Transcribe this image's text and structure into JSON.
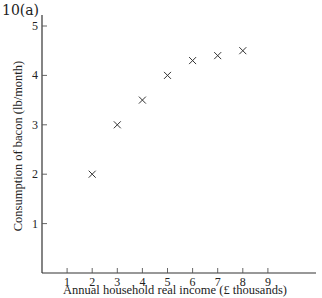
{
  "figure_label": "10(a)",
  "chart_data": {
    "type": "scatter",
    "title": "",
    "xlabel": "Annual household real income (£ thousands)",
    "ylabel": "Consumption of bacon (lb/month)",
    "xlim": [
      0,
      10
    ],
    "ylim": [
      0,
      5.2
    ],
    "x_ticks": [
      1,
      2,
      3,
      4,
      5,
      6,
      7,
      8,
      9
    ],
    "y_ticks": [
      1,
      2,
      3,
      4,
      5
    ],
    "grid": false,
    "marker": "x",
    "series": [
      {
        "name": "Bacon consumption",
        "x": [
          2,
          3,
          4,
          5,
          6,
          7,
          8
        ],
        "y": [
          2.0,
          3.0,
          3.5,
          4.0,
          4.3,
          4.4,
          4.5
        ]
      }
    ]
  }
}
